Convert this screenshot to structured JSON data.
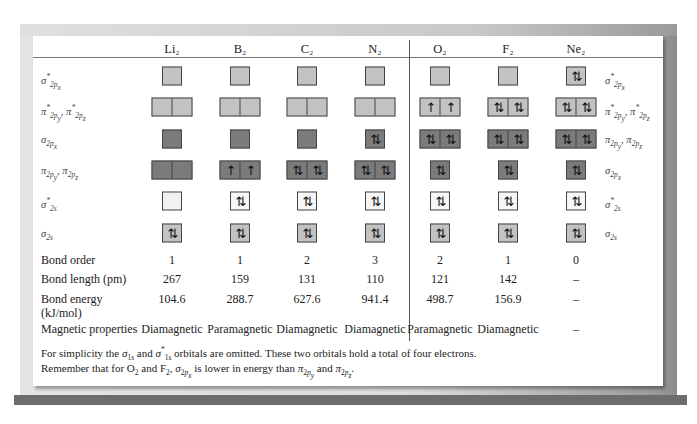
{
  "table": {
    "molecules": [
      "Li₂",
      "B₂",
      "C₂",
      "N₂",
      "O₂",
      "F₂",
      "Ne₂"
    ],
    "left_orbital_labels": [
      "σ*2px",
      "π*2py, π*2pz",
      "σ2px",
      "π2py, π2pz",
      "σ*2s",
      "σ2s"
    ],
    "right_orbital_labels": [
      "σ*2px",
      "π*2py, π*2pz",
      "π2py, π2pz",
      "σ2px",
      "σ*2s",
      "σ2s"
    ],
    "orbital_rows": [
      {
        "name": "sigma-star-2px",
        "cells": [
          "",
          "",
          "",
          "",
          "",
          "",
          "⇅"
        ]
      },
      {
        "name": "pi-star-2p",
        "cells": [
          [
            "",
            ""
          ],
          [
            "",
            ""
          ],
          [
            "",
            ""
          ],
          [
            "",
            ""
          ],
          [
            "↑",
            "↑"
          ],
          [
            "⇅",
            "⇅"
          ],
          [
            "⇅",
            "⇅"
          ]
        ]
      },
      {
        "name": "row3",
        "cells": [
          "",
          "",
          "",
          "⇅",
          [
            "⇅",
            "⇅"
          ],
          [
            "⇅",
            "⇅"
          ],
          [
            "⇅",
            "⇅"
          ]
        ]
      },
      {
        "name": "row4",
        "cells": [
          [
            "",
            ""
          ],
          [
            "↑",
            "↑"
          ],
          [
            "⇅",
            "⇅"
          ],
          [
            "⇅",
            "⇅"
          ],
          "⇅",
          "⇅",
          "⇅"
        ]
      },
      {
        "name": "sigma-star-2s",
        "cells": [
          "",
          "⇅",
          "⇅",
          "⇅",
          "⇅",
          "⇅",
          "⇅"
        ]
      },
      {
        "name": "sigma-2s",
        "cells": [
          "⇅",
          "⇅",
          "⇅",
          "⇅",
          "⇅",
          "⇅",
          "⇅"
        ]
      }
    ],
    "properties": {
      "bond_order": {
        "label": "Bond order",
        "values": [
          "1",
          "1",
          "2",
          "3",
          "2",
          "1",
          "0"
        ]
      },
      "bond_length": {
        "label": "Bond length (pm)",
        "values": [
          "267",
          "159",
          "131",
          "110",
          "121",
          "142",
          "–"
        ]
      },
      "bond_energy": {
        "label": "Bond energy",
        "label2": "(kJ/mol)",
        "values": [
          "104.6",
          "288.7",
          "627.6",
          "941.4",
          "498.7",
          "156.9",
          "–"
        ]
      },
      "magnetic": {
        "label": "Magnetic properties",
        "values": [
          "Diamagnetic",
          "Paramagnetic",
          "Diamagnetic",
          "Diamagnetic",
          "Paramagnetic",
          "Diamagnetic",
          "–"
        ]
      }
    }
  },
  "notes": {
    "line1_a": "For simplicity the ",
    "line1_b": " and ",
    "line1_c": " orbitals are omitted.  These two orbitals hold a total of four electrons.",
    "line2_a": "Remember that for O",
    "line2_b": " and F",
    "line2_c": ", ",
    "line2_d": " is lower in energy than ",
    "line2_e": " and ",
    "line2_f": "."
  },
  "colors": {
    "antibonding_box": "#c2c2c2",
    "bonding_box": "#7b7b7b",
    "sigma2s_star_box": "#f6f6f6"
  }
}
